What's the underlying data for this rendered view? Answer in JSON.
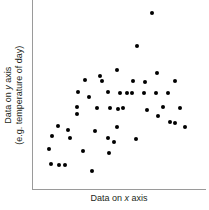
{
  "chart_data": {
    "type": "scatter",
    "title": "",
    "xlabel": "Data on x axis",
    "ylabel_line1": "Data on y axis",
    "ylabel_line2": "(e.g. temperature of day)",
    "xlabel_plain": "Data on ",
    "xlabel_italic": "x",
    "xlabel_tail": " axis",
    "ylabel1_plain": "Data on ",
    "ylabel1_italic": "y",
    "ylabel1_tail": " axis",
    "grid": false,
    "legend": false,
    "axis_ticks": false,
    "xlim": [
      0,
      100
    ],
    "ylim": [
      0,
      100
    ],
    "marker_color": "#000000",
    "axis_color": "#9a9a9a",
    "background_color": "#ffffff",
    "n_points": 48,
    "points": [
      {
        "x": 68.8,
        "y": 92.9
      },
      {
        "x": 59.9,
        "y": 75.7
      },
      {
        "x": 48.3,
        "y": 62.9
      },
      {
        "x": 38.6,
        "y": 59.8
      },
      {
        "x": 71.4,
        "y": 61.3
      },
      {
        "x": 29.9,
        "y": 57.7
      },
      {
        "x": 57.8,
        "y": 57.0
      },
      {
        "x": 64.7,
        "y": 56.5
      },
      {
        "x": 81.9,
        "y": 57.2
      },
      {
        "x": 43.1,
        "y": 51.5
      },
      {
        "x": 50.3,
        "y": 50.9
      },
      {
        "x": 54.2,
        "y": 50.7
      },
      {
        "x": 57.0,
        "y": 50.6
      },
      {
        "x": 63.9,
        "y": 50.8
      },
      {
        "x": 71.1,
        "y": 50.8
      },
      {
        "x": 78.0,
        "y": 50.9
      },
      {
        "x": 37.2,
        "y": 43.0
      },
      {
        "x": 44.5,
        "y": 42.6
      },
      {
        "x": 49.3,
        "y": 42.4
      },
      {
        "x": 25.6,
        "y": 43.6
      },
      {
        "x": 25.6,
        "y": 39.5
      },
      {
        "x": 66.0,
        "y": 41.8
      },
      {
        "x": 72.2,
        "y": 38.6
      },
      {
        "x": 79.1,
        "y": 35.4
      },
      {
        "x": 82.3,
        "y": 34.9
      },
      {
        "x": 87.9,
        "y": 32.6
      },
      {
        "x": 14.7,
        "y": 33.3
      },
      {
        "x": 20.0,
        "y": 31.1
      },
      {
        "x": 36.1,
        "y": 30.5
      },
      {
        "x": 48.7,
        "y": 33.0
      },
      {
        "x": 10.9,
        "y": 28.0
      },
      {
        "x": 21.3,
        "y": 27.0
      },
      {
        "x": 43.6,
        "y": 26.8
      },
      {
        "x": 47.0,
        "y": 24.8
      },
      {
        "x": 59.6,
        "y": 26.6
      },
      {
        "x": 9.2,
        "y": 21.1
      },
      {
        "x": 29.0,
        "y": 20.3
      },
      {
        "x": 44.0,
        "y": 19.2
      },
      {
        "x": 10.5,
        "y": 13.1
      },
      {
        "x": 15.2,
        "y": 12.8
      },
      {
        "x": 18.6,
        "y": 12.8
      },
      {
        "x": 34.0,
        "y": 9.5
      },
      {
        "x": 52.2,
        "y": 42.7
      },
      {
        "x": 32.1,
        "y": 48.6
      },
      {
        "x": 26.0,
        "y": 51.3
      },
      {
        "x": 40.0,
        "y": 57.3
      },
      {
        "x": 75.3,
        "y": 43.3
      },
      {
        "x": 85.0,
        "y": 42.9
      }
    ]
  }
}
